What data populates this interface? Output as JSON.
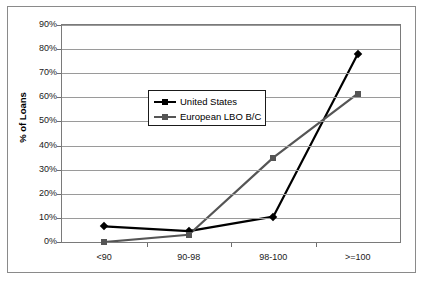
{
  "chart_data": {
    "type": "line",
    "title": "",
    "xlabel": "",
    "ylabel": "% of Loans",
    "categories": [
      "<90",
      "90-98",
      "98-100",
      ">=100"
    ],
    "ylim": [
      0,
      90
    ],
    "ytick_labels": [
      "0%",
      "10%",
      "20%",
      "30%",
      "40%",
      "50%",
      "60%",
      "70%",
      "80%",
      "90%"
    ],
    "ytick_values": [
      0,
      10,
      20,
      30,
      40,
      50,
      60,
      70,
      80,
      90
    ],
    "grid": true,
    "legend_position": "upper-center",
    "series": [
      {
        "name": "United States",
        "color": "#000000",
        "marker": "diamond",
        "values": [
          6.5,
          4.5,
          10.5,
          78
        ]
      },
      {
        "name": "European LBO B/C",
        "color": "#555555",
        "marker": "square",
        "values": [
          0,
          3,
          35,
          61.5
        ]
      }
    ]
  },
  "legend": {
    "entries": [
      {
        "label": "United States"
      },
      {
        "label": "European LBO B/C"
      }
    ]
  },
  "axes": {
    "y_title": "% of Loans"
  },
  "colors": {
    "series_us": "#000000",
    "series_eu": "#555555",
    "gridline": "#9a9a9a",
    "frame": "#7a7a7a",
    "outer_border": "#8a8a8a",
    "text": "#1a1a1a",
    "background": "#ffffff"
  }
}
